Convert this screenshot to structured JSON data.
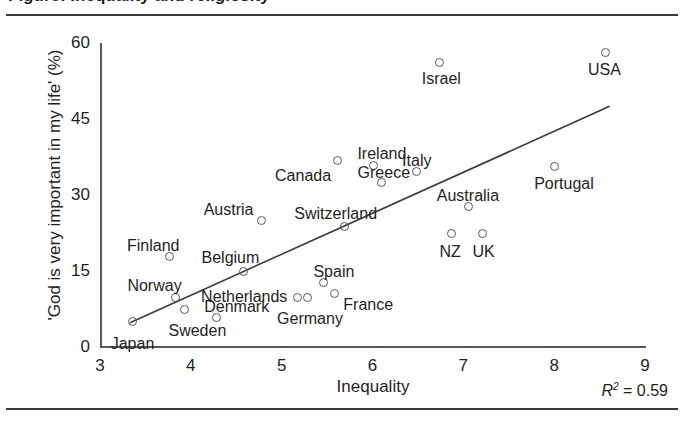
{
  "figure": {
    "title_clipped": "Figure: Inequality and religiosity",
    "top_rule": true,
    "bottom_rule": true
  },
  "chart_data": {
    "type": "scatter",
    "title": "",
    "xlabel": "Inequality",
    "ylabel": "'God is very important in my life' (%)",
    "xlim": [
      3,
      9
    ],
    "ylim": [
      0,
      60
    ],
    "xticks": [
      3,
      4,
      5,
      6,
      7,
      8,
      9
    ],
    "yticks": [
      0,
      15,
      30,
      45,
      60
    ],
    "grid": false,
    "legend": null,
    "annotations": [
      {
        "name": "r2",
        "text_italic": "R",
        "text_sup": "2",
        "text_rest": " = 0.59",
        "full": "R2 = 0.59"
      }
    ],
    "trendline": {
      "visible": true,
      "x_start": 3.33,
      "y_start": 4.8,
      "x_end": 8.61,
      "y_end": 47.5
    },
    "points": [
      {
        "label": "Japan",
        "x": 3.36,
        "y": 5.1,
        "label_dx": -22,
        "label_dy": 14
      },
      {
        "label": "Finland",
        "x": 3.76,
        "y": 17.8,
        "label_dx": -42,
        "label_dy": -20
      },
      {
        "label": "Norway",
        "x": 3.83,
        "y": 9.8,
        "label_dx": -48,
        "label_dy": -20
      },
      {
        "label": "Sweden",
        "x": 3.93,
        "y": 7.4,
        "label_dx": -16,
        "label_dy": 12
      },
      {
        "label": "Denmark",
        "x": 4.28,
        "y": 5.8,
        "label_dx": -12,
        "label_dy": -20
      },
      {
        "label": "Belgium",
        "x": 4.58,
        "y": 15.0,
        "label_dx": -42,
        "label_dy": -22
      },
      {
        "label": "Austria",
        "x": 4.78,
        "y": 24.9,
        "label_dx": -58,
        "label_dy": -20
      },
      {
        "label": "Netherlands",
        "x": 5.17,
        "y": 9.7,
        "label_dx": -96,
        "label_dy": -10
      },
      {
        "label": "Germany",
        "x": 5.28,
        "y": 9.7,
        "label_dx": -30,
        "label_dy": 12
      },
      {
        "label": "Spain",
        "x": 5.46,
        "y": 12.7,
        "label_dx": -10,
        "label_dy": -20
      },
      {
        "label": "France",
        "x": 5.58,
        "y": 10.5,
        "label_dx": 9,
        "label_dy": 2
      },
      {
        "label": "Canada",
        "x": 5.61,
        "y": 36.8,
        "label_dx": -62,
        "label_dy": 6
      },
      {
        "label": "Switzerland",
        "x": 5.69,
        "y": 23.7,
        "label_dx": -50,
        "label_dy": -22
      },
      {
        "label": "Ireland",
        "x": 6.01,
        "y": 35.9,
        "label_dx": -16,
        "label_dy": -20
      },
      {
        "label": "Greece",
        "x": 6.1,
        "y": 32.4,
        "label_dx": -24,
        "label_dy": -19
      },
      {
        "label": "Italy",
        "x": 6.48,
        "y": 34.6,
        "label_dx": -14,
        "label_dy": -20
      },
      {
        "label": "Israel",
        "x": 6.74,
        "y": 56.2,
        "label_dx": -18,
        "label_dy": 8
      },
      {
        "label": "NZ",
        "x": 6.87,
        "y": 22.4,
        "label_dx": -12,
        "label_dy": 9
      },
      {
        "label": "Australia",
        "x": 7.06,
        "y": 27.7,
        "label_dx": -32,
        "label_dy": -20
      },
      {
        "label": "UK",
        "x": 7.21,
        "y": 22.4,
        "label_dx": -10,
        "label_dy": 9
      },
      {
        "label": "Portugal",
        "x": 8.0,
        "y": 35.6,
        "label_dx": -20,
        "label_dy": 8
      },
      {
        "label": "USA",
        "x": 8.56,
        "y": 58.1,
        "label_dx": -17,
        "label_dy": 8
      }
    ]
  }
}
